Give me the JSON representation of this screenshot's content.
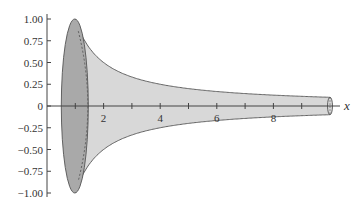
{
  "chart_data": {
    "type": "area",
    "title": "",
    "xlabel": "x",
    "ylabel": "",
    "xlim": [
      0,
      10.5
    ],
    "ylim": [
      -1.0,
      1.0
    ],
    "x_tick_labels": [
      "2",
      "4",
      "6",
      "8"
    ],
    "x_ticks": [
      1,
      2,
      3,
      4,
      5,
      6,
      7,
      8,
      9
    ],
    "y_tick_labels": [
      "1.00",
      "0.75",
      "0.50",
      "0.25",
      "0",
      "−0.25",
      "−0.50",
      "−0.75",
      "−1.00"
    ],
    "y_ticks": [
      1.0,
      0.75,
      0.5,
      0.25,
      0,
      -0.25,
      -0.5,
      -0.75,
      -1.0
    ],
    "series": [
      {
        "name": "upper",
        "function": "1/x",
        "x": [
          1,
          1.5,
          2,
          3,
          4,
          5,
          6,
          7,
          8,
          9,
          10
        ],
        "values": [
          1.0,
          0.667,
          0.5,
          0.333,
          0.25,
          0.2,
          0.167,
          0.143,
          0.125,
          0.111,
          0.1
        ]
      },
      {
        "name": "lower",
        "function": "-1/x",
        "x": [
          1,
          1.5,
          2,
          3,
          4,
          5,
          6,
          7,
          8,
          9,
          10
        ],
        "values": [
          -1.0,
          -0.667,
          -0.5,
          -0.333,
          -0.25,
          -0.2,
          -0.167,
          -0.143,
          -0.125,
          -0.111,
          -0.1
        ]
      }
    ],
    "colors": {
      "fill": "#d8d8d8",
      "cap_fill": "#a9a9a9",
      "line": "#555555"
    },
    "grid": false,
    "legend": null
  }
}
